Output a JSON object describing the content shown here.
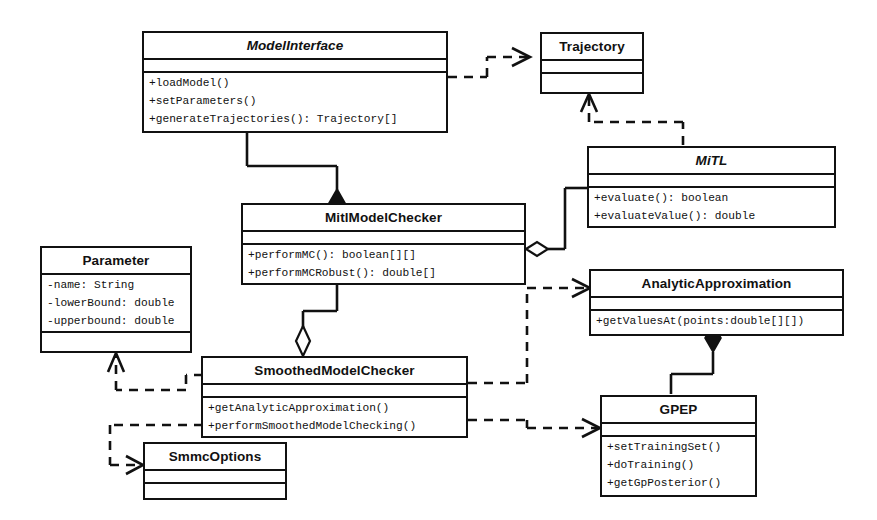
{
  "diagram": {
    "type": "uml-class-diagram",
    "stroke_color": "#111111",
    "background_color": "#ffffff"
  },
  "classes": [
    {
      "id": "model-interface",
      "name": "ModelInterface",
      "abstract": true,
      "attributes": [],
      "operations": [
        "+loadModel()",
        "+setParameters()",
        "+generateTrajectories(): Trajectory[]"
      ]
    },
    {
      "id": "trajectory",
      "name": "Trajectory",
      "abstract": false,
      "attributes": [],
      "operations": []
    },
    {
      "id": "mitl",
      "name": "MiTL",
      "abstract": true,
      "attributes": [],
      "operations": [
        "+evaluate(): boolean",
        "+evaluateValue(): double"
      ]
    },
    {
      "id": "mitl-model-checker",
      "name": "MitlModelChecker",
      "abstract": false,
      "attributes": [],
      "operations": [
        "+performMC(): boolean[][]",
        "+performMCRobust(): double[]"
      ]
    },
    {
      "id": "parameter",
      "name": "Parameter",
      "abstract": false,
      "attributes": [
        "-name: String",
        "-lowerBound: double",
        "-upperbound: double"
      ],
      "operations": []
    },
    {
      "id": "analytic-approximation",
      "name": "AnalyticApproximation",
      "abstract": false,
      "attributes": [],
      "operations": [
        "+getValuesAt(points:double[][])"
      ]
    },
    {
      "id": "smoothed-model-checker",
      "name": "SmoothedModelChecker",
      "abstract": false,
      "attributes": [],
      "operations": [
        "+getAnalyticApproximation()",
        "+performSmoothedModelChecking()"
      ]
    },
    {
      "id": "gpep",
      "name": "GPEP",
      "abstract": false,
      "attributes": [],
      "operations": [
        "+setTrainingSet()",
        "+doTraining()",
        "+getGpPosterior()"
      ]
    },
    {
      "id": "smmc-options",
      "name": "SmmcOptions",
      "abstract": false,
      "attributes": [],
      "operations": []
    }
  ],
  "relationships": [
    {
      "id": "dep-modelinterface-trajectory",
      "kind": "dependency",
      "from": "model-interface",
      "to": "trajectory"
    },
    {
      "id": "dep-mitl-trajectory",
      "kind": "dependency",
      "from": "mitl",
      "to": "trajectory"
    },
    {
      "id": "comp-modelinterface-mitlmodelchecker",
      "kind": "composition",
      "from": "mitl-model-checker",
      "to": "model-interface"
    },
    {
      "id": "agg-mitlmodelchecker-mitl",
      "kind": "aggregation",
      "from": "mitl-model-checker",
      "to": "mitl"
    },
    {
      "id": "agg-smoothed-mitlmodelchecker",
      "kind": "aggregation",
      "from": "smoothed-model-checker",
      "to": "mitl-model-checker"
    },
    {
      "id": "dep-smoothed-parameter",
      "kind": "dependency",
      "from": "smoothed-model-checker",
      "to": "parameter"
    },
    {
      "id": "dep-smoothed-analytic",
      "kind": "dependency",
      "from": "smoothed-model-checker",
      "to": "analytic-approximation"
    },
    {
      "id": "dep-smoothed-gpep",
      "kind": "dependency",
      "from": "smoothed-model-checker",
      "to": "gpep"
    },
    {
      "id": "dep-smoothed-smmcoptions",
      "kind": "dependency",
      "from": "smoothed-model-checker",
      "to": "smmc-options"
    },
    {
      "id": "comp-analytic-gpep",
      "kind": "composition",
      "from": "analytic-approximation",
      "to": "gpep"
    }
  ]
}
